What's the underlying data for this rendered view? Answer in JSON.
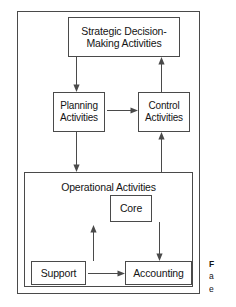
{
  "figure": {
    "diagram_type": "hierarchy-block-diagram",
    "nodes": {
      "strategic": {
        "label": "Strategic Decision-\nMaking Activities"
      },
      "planning": {
        "label": "Planning\nActivities"
      },
      "control": {
        "label": "Control\nActivities"
      },
      "operational": {
        "label": "Operational Activities"
      },
      "core": {
        "label": "Core"
      },
      "support": {
        "label": "Support"
      },
      "accounting": {
        "label": "Accounting"
      }
    },
    "connectors": [
      {
        "name": "strategic-to-planning",
        "from": "strategic",
        "to": "planning",
        "direction": "down"
      },
      {
        "name": "control-to-strategic",
        "from": "control",
        "to": "strategic",
        "direction": "up"
      },
      {
        "name": "planning-to-operational",
        "from": "planning",
        "to": "operational",
        "direction": "down"
      },
      {
        "name": "operational-to-control",
        "from": "operational",
        "to": "control",
        "direction": "up"
      },
      {
        "name": "planning-to-control",
        "from": "planning",
        "to": "control",
        "direction": "right"
      },
      {
        "name": "support-to-core",
        "from": "support",
        "to": "core",
        "direction": "up"
      },
      {
        "name": "core-to-accounting",
        "from": "core",
        "to": "accounting",
        "direction": "down"
      },
      {
        "name": "support-to-accounting",
        "from": "support",
        "to": "accounting",
        "direction": "right"
      }
    ],
    "caption": {
      "lead": "F",
      "line2": "a",
      "line3": "e"
    },
    "colors": {
      "background": "#ffffff",
      "stroke": "#4a4a4a",
      "text": "#141414"
    }
  }
}
